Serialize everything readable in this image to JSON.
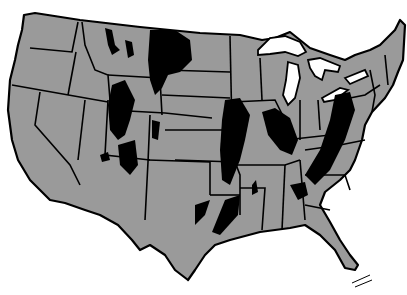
{
  "map": {
    "subject": "United States (contiguous) outline map with state boundaries",
    "colors": {
      "background": "#ffffff",
      "land": "#9a9a9a",
      "deposit": "#000000",
      "boundary": "#000000",
      "lakes": "#ffffff"
    },
    "legend": null,
    "regions_highlighted": [
      "Northern Rockies / Montana",
      "Wyoming / Utah / Colorado basins",
      "Illinois basin",
      "Michigan basin",
      "Appalachian basin",
      "East Texas / Louisiana",
      "Alabama / Black Warrior"
    ]
  }
}
